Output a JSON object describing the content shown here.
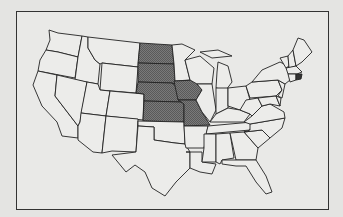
{
  "map": {
    "title": "Contiguous United States",
    "type": "choropleth-outline",
    "highlight_color": "#6e6e6e",
    "base_color": "#ececea",
    "highlighted_states": [
      "North Dakota",
      "South Dakota",
      "Nebraska",
      "Kansas",
      "Iowa",
      "Missouri",
      "Rhode Island"
    ],
    "legend": null
  }
}
